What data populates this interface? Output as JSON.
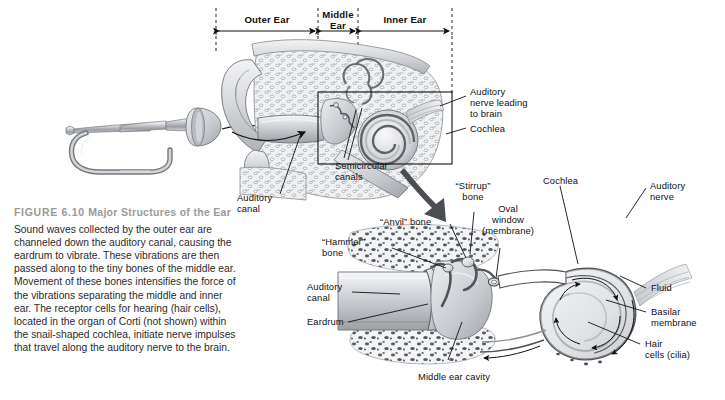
{
  "figure": {
    "label": "FIGURE 6.10",
    "title": "Major Structures of the Ear",
    "caption": "Sound waves collected by the outer ear are channeled down the auditory canal, causing the eardrum to vibrate. These vibrations are then passed along to the tiny bones of the middle ear. Movement of these bones intensifies the force of the vibrations separating the middle and inner ear. The receptor cells for hearing (hair cells), located in the organ of Corti (not shown) within the snail-shaped cochlea, initiate nerve impulses that travel along the auditory nerve to the brain."
  },
  "regions": [
    {
      "name": "outer-ear",
      "label": "Outer Ear"
    },
    {
      "name": "middle-ear",
      "label": "Middle\nEar"
    },
    {
      "name": "inner-ear",
      "label": "Inner Ear"
    }
  ],
  "main_diagram_labels": [
    {
      "name": "auditory-nerve-leading-to-brain",
      "label": "Auditory\nnerve leading\nto brain"
    },
    {
      "name": "cochlea",
      "label": "Cochlea"
    },
    {
      "name": "semicircular-canals",
      "label": "Semicircular\ncanals"
    },
    {
      "name": "auditory-canal",
      "label": "Auditory\ncanal"
    }
  ],
  "detail_diagram_labels": [
    {
      "name": "stirrup-bone",
      "label": "“Stirrup”\nbone"
    },
    {
      "name": "oval-window-membrane",
      "label": "Oval\nwindow\n(membrane)"
    },
    {
      "name": "anvil-bone",
      "label": "“Anvil” bone"
    },
    {
      "name": "hammer-bone",
      "label": "“Hammer”\nbone"
    },
    {
      "name": "auditory-canal-detail",
      "label": "Auditory\ncanal"
    },
    {
      "name": "eardrum",
      "label": "Eardrum"
    },
    {
      "name": "middle-ear-cavity",
      "label": "Middle ear cavity"
    },
    {
      "name": "cochlea-detail",
      "label": "Cochlea"
    },
    {
      "name": "auditory-nerve",
      "label": "Auditory\nnerve"
    },
    {
      "name": "fluid",
      "label": "Fluid"
    },
    {
      "name": "basilar-membrane",
      "label": "Basilar\nmembrane"
    },
    {
      "name": "hair-cells-cilia",
      "label": "Hair\ncells (cilia)"
    }
  ],
  "illustrations": [
    {
      "name": "bugle",
      "label": "bugle-illustration"
    },
    {
      "name": "ear-cross-section",
      "label": "ear-cross-section-illustration"
    },
    {
      "name": "middle-inner-ear-detail",
      "label": "middle-and-inner-ear-detail-illustration"
    }
  ],
  "colors": {
    "background": "#ffffff",
    "caption_heading": "#9a9a9a",
    "caption_body": "#2b2b2b",
    "label_text": "#111111",
    "line": "#1a1a1a",
    "art_mid": "#b9bcc0",
    "art_dark": "#6f7276",
    "art_light": "#e3e5e8",
    "zoom_arrow": "#4a4d51"
  }
}
